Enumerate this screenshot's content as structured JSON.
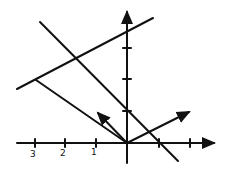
{
  "diagram": {
    "axes": {
      "x_tick_labels": [
        "3",
        "2",
        "1"
      ],
      "origin_px": [
        127,
        143
      ],
      "unit_px": 31
    },
    "colors": {
      "ink": "#111111",
      "background": "#ffffff"
    }
  }
}
